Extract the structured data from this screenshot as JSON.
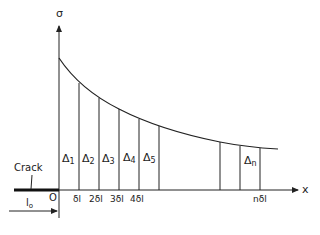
{
  "diagram": {
    "axes": {
      "y_label": "σ",
      "x_label": "x",
      "origin_label": "O"
    },
    "crack": {
      "label": "Crack",
      "length_label": "l",
      "length_subscript": "o"
    },
    "strips": [
      {
        "label": "Δ",
        "sub": "1"
      },
      {
        "label": "Δ",
        "sub": "2"
      },
      {
        "label": "Δ",
        "sub": "3"
      },
      {
        "label": "Δ",
        "sub": "4"
      },
      {
        "label": "Δ",
        "sub": "5"
      },
      {
        "label": "Δ",
        "sub": "n"
      }
    ],
    "ticks": [
      "δl",
      "2δl",
      "3δl",
      "4δl",
      "nδl"
    ],
    "colors": {
      "line": "#222222",
      "background": "#ffffff"
    }
  }
}
